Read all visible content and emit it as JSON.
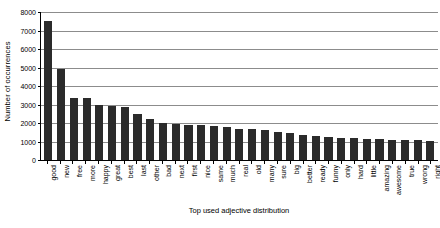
{
  "chart_data": {
    "type": "bar",
    "title": "",
    "xlabel": "Top used adjective distribution",
    "ylabel": "Number of occurrences",
    "ylim": [
      0,
      8000
    ],
    "ytick_labels": [
      "8000",
      "7000",
      "6000",
      "5000",
      "4000",
      "3000",
      "2000",
      "1000",
      "0"
    ],
    "ytick_values": [
      8000,
      7000,
      6000,
      5000,
      4000,
      3000,
      2000,
      1000,
      0
    ],
    "grid": true,
    "legend": "none",
    "bar_color": "#2b2b2b",
    "gridline_color": "#8c8c8c",
    "axis_color": "#000000",
    "categories": [
      "good",
      "new",
      "free",
      "more",
      "happy",
      "great",
      "best",
      "last",
      "other",
      "bad",
      "next",
      "first",
      "nice",
      "same",
      "much",
      "real",
      "old",
      "many",
      "sure",
      "big",
      "better",
      "ready",
      "funny",
      "only",
      "hard",
      "little",
      "amazing",
      "awesome",
      "true",
      "wrong",
      "right"
    ],
    "values": [
      7500,
      4900,
      3350,
      3330,
      2950,
      2900,
      2850,
      2500,
      2200,
      2000,
      1950,
      1900,
      1870,
      1840,
      1800,
      1700,
      1650,
      1600,
      1500,
      1450,
      1350,
      1300,
      1220,
      1200,
      1180,
      1150,
      1120,
      1100,
      1080,
      1060,
      1050
    ]
  }
}
